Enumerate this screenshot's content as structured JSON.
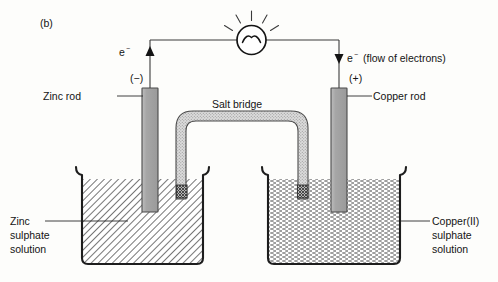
{
  "figure": {
    "panel_label": "(b)",
    "alt_description": "Daniell cell: zinc rod in zinc sulphate solution joined by a salt bridge to a copper rod in copper(II) sulphate solution, wired through a lamp."
  },
  "circuit": {
    "lamp_name": "lamp-bulb",
    "left_terminal_sign": "(−)",
    "right_terminal_sign": "(+)",
    "electron_symbol_left": "e",
    "electron_superscript_left": "−",
    "electron_symbol_right": "e",
    "electron_superscript_right": "−",
    "flow_note": "(flow of electrons)",
    "left_arrow_direction": "up",
    "right_arrow_direction": "down"
  },
  "labels": {
    "zinc_rod": "Zinc rod",
    "copper_rod": "Copper rod",
    "salt_bridge": "Salt bridge",
    "left_solution": [
      "Zinc",
      "sulphate",
      "solution"
    ],
    "right_solution": [
      "Copper(II)",
      "sulphate",
      "solution"
    ]
  },
  "colors": {
    "background": "#fdfdfb",
    "ink": "#141414",
    "beaker_outline": "#1d1d1d",
    "electrode_fill": "#a8a8a8",
    "electrode_stroke": "#4a4a4a",
    "wire": "#3b3b3b",
    "salt_bridge_fill": "#d2d2d2",
    "zinc_solution_hatch": "#6f6f6f",
    "copper_solution_stipple": "#6f6f6f"
  },
  "cells": {
    "left": {
      "electrode": "zinc-rod",
      "electrode_polarity": "negative",
      "solution_fill_pattern": "diagonal-hatch"
    },
    "right": {
      "electrode": "copper-rod",
      "electrode_polarity": "positive",
      "solution_fill_pattern": "stipple-dash"
    }
  }
}
